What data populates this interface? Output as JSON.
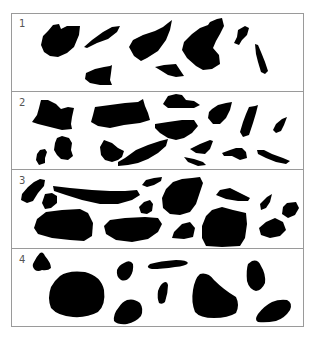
{
  "figure": {
    "colors": {
      "shape": "#000000",
      "background": "#ffffff",
      "border": "#9a9a9a",
      "label": "#555555"
    },
    "panels": [
      {
        "label": "1",
        "shape_count": 9
      },
      {
        "label": "2",
        "shape_count": 17
      },
      {
        "label": "3",
        "shape_count": 16
      },
      {
        "label": "4",
        "shape_count": 10
      }
    ]
  }
}
